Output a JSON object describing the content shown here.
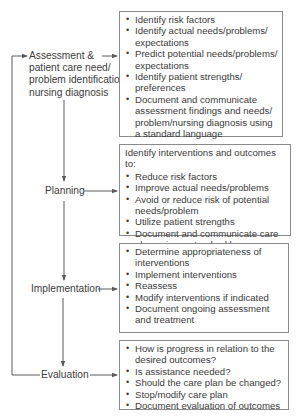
{
  "diagram": {
    "title": "",
    "colors": {
      "line": "#5a5a5a",
      "box_border": "#8a8a8a",
      "text": "#3a3a3a",
      "background": "#ffffff"
    },
    "stages": [
      {
        "id": "assessment",
        "label": "Assessment & patient care need/ problem identification/ nursing diagnosis",
        "label_lines": [
          "Assessment &",
          "patient care need/",
          "problem identification/",
          "nursing diagnosis"
        ],
        "intro": "",
        "items": [
          "Identify risk factors",
          "Identify actual needs/problems/ expectations",
          "Predict potential needs/problems/ expectations",
          "Identify patient strengths/ preferences",
          "Document and communicate assessment findings and needs/ problem/nursing diagnosis using a standard language"
        ]
      },
      {
        "id": "planning",
        "label": "Planning",
        "label_lines": [
          "Planning"
        ],
        "intro": "Identify interventions and outcomes to:",
        "items": [
          "Reduce risk factors",
          "Improve actual needs/problems",
          "Avoid or reduce risk of potential needs/problem",
          "Utilize patient strengths",
          "Document and communicate care plan using a standard language"
        ]
      },
      {
        "id": "implementation",
        "label": "Implementation",
        "label_lines": [
          "Implementation"
        ],
        "intro": "",
        "items": [
          "Determine appropriateness of interventions",
          "Implement interventions",
          "Reassess",
          "Modify interventions if indicated",
          "Document ongoing assessment and treatment"
        ]
      },
      {
        "id": "evaluation",
        "label": "Evaluation",
        "label_lines": [
          "Evaluation"
        ],
        "intro": "",
        "items": [
          "How is progress in relation to the desired outcomes?",
          "Is assistance needed?",
          "Should the care plan be changed?",
          "Stop/modify care plan",
          "Document evaluation of outcomes"
        ]
      }
    ],
    "connections": [
      {
        "from": "assessment",
        "to": "planning",
        "type": "arrow-down"
      },
      {
        "from": "planning",
        "to": "implementation",
        "type": "arrow-down"
      },
      {
        "from": "implementation",
        "to": "evaluation",
        "type": "arrow-down"
      },
      {
        "from": "evaluation",
        "to": "assessment",
        "type": "feedback-loop-left"
      },
      {
        "from": "assessment",
        "to": "assessment-box",
        "type": "arrow-right"
      },
      {
        "from": "planning",
        "to": "planning-box",
        "type": "arrow-right"
      },
      {
        "from": "implementation",
        "to": "implementation-box",
        "type": "arrow-right"
      },
      {
        "from": "evaluation",
        "to": "evaluation-box",
        "type": "arrow-right"
      }
    ]
  }
}
